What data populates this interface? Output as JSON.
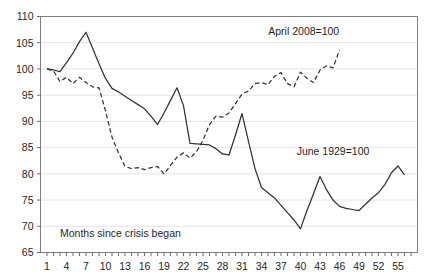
{
  "chart_data": {
    "type": "line",
    "title": "",
    "subtitle": "",
    "xlabel": "Months since crisis began",
    "ylabel": "",
    "xlim": [
      0,
      58
    ],
    "ylim": [
      65,
      110
    ],
    "yticks": [
      65,
      70,
      75,
      80,
      85,
      90,
      95,
      100,
      105,
      110
    ],
    "ytick_labels": [
      "65",
      "70",
      "75",
      "80",
      "85",
      "90",
      "95",
      "100",
      "105",
      "110"
    ],
    "xticks": [
      1,
      2,
      3,
      4,
      5,
      6,
      7,
      8,
      9,
      10,
      11,
      12,
      13,
      14,
      15,
      16,
      17,
      18,
      19,
      20,
      21,
      22,
      23,
      24,
      25,
      26,
      27,
      28,
      29,
      30,
      31,
      32,
      33,
      34,
      35,
      36,
      37,
      38,
      39,
      40,
      41,
      42,
      43,
      44,
      45,
      46,
      47,
      48,
      49,
      50,
      51,
      52,
      53,
      54,
      55,
      56,
      57
    ],
    "xtick_labels_shown": [
      "1",
      "4",
      "7",
      "10",
      "13",
      "16",
      "19",
      "22",
      "25",
      "28",
      "31",
      "34",
      "37",
      "40",
      "43",
      "46",
      "49",
      "52",
      "55"
    ],
    "xtick_label_values": [
      1,
      4,
      7,
      10,
      13,
      16,
      19,
      22,
      25,
      28,
      31,
      34,
      37,
      40,
      43,
      46,
      49,
      52,
      55
    ],
    "grid": "horizontal",
    "legend_position": "inline-annotations",
    "annotations": [
      {
        "text": "April 2008=100",
        "x": 40.5,
        "y": 106.4,
        "series": "april-2008"
      },
      {
        "text": "June 1929=100",
        "x": 45.0,
        "y": 83.6,
        "series": "june-1929"
      },
      {
        "text": "Months since crisis began",
        "x": 3.0,
        "y": 68.0,
        "series": "axis-note"
      }
    ],
    "series": [
      {
        "name": "June 1929=100",
        "style": "solid",
        "color": "#333333",
        "x": [
          1,
          2,
          3,
          4,
          5,
          6,
          7,
          8,
          9,
          10,
          11,
          12,
          13,
          14,
          15,
          16,
          17,
          18,
          19,
          20,
          21,
          22,
          23,
          24,
          25,
          26,
          27,
          28,
          29,
          30,
          31,
          32,
          33,
          34,
          35,
          36,
          37,
          38,
          39,
          40,
          41,
          42,
          43,
          44,
          45,
          46,
          47,
          48,
          49,
          50,
          51,
          52,
          53,
          54,
          55,
          56
        ],
        "values": [
          100.0,
          99.8,
          99.5,
          101.2,
          103.0,
          105.2,
          107.0,
          104.0,
          101.0,
          98.2,
          96.3,
          95.6,
          94.8,
          94.0,
          93.2,
          92.4,
          91.0,
          89.4,
          91.6,
          94.0,
          96.4,
          93.0,
          85.8,
          85.7,
          85.6,
          85.5,
          84.8,
          83.8,
          83.6,
          87.4,
          91.5,
          86.2,
          81.0,
          77.4,
          76.4,
          75.4,
          74.0,
          72.6,
          71.2,
          69.5,
          73.0,
          76.2,
          79.5,
          77.0,
          75.0,
          73.8,
          73.4,
          73.2,
          73.0,
          74.2,
          75.4,
          76.4,
          78.0,
          80.2,
          81.5,
          79.8
        ]
      },
      {
        "name": "April 2008=100",
        "style": "dashed",
        "color": "#333333",
        "x": [
          1,
          2,
          3,
          4,
          5,
          6,
          7,
          8,
          9,
          10,
          11,
          12,
          13,
          14,
          15,
          16,
          17,
          18,
          19,
          20,
          21,
          22,
          23,
          24,
          25,
          26,
          27,
          28,
          29,
          30,
          31,
          32,
          33,
          34,
          35,
          36,
          37,
          38,
          39,
          40,
          41,
          42,
          43,
          44,
          45,
          46
        ],
        "values": [
          100.0,
          99.6,
          97.6,
          98.4,
          97.2,
          98.4,
          97.4,
          96.6,
          96.4,
          92.0,
          87.0,
          84.0,
          81.4,
          81.0,
          81.2,
          80.8,
          81.2,
          81.4,
          80.0,
          81.6,
          83.2,
          84.0,
          83.0,
          84.2,
          86.4,
          89.4,
          91.0,
          90.8,
          91.6,
          93.4,
          95.2,
          95.8,
          97.2,
          97.4,
          97.0,
          98.6,
          99.3,
          97.2,
          96.6,
          99.4,
          98.2,
          97.4,
          99.8,
          100.6,
          100.2,
          103.6
        ]
      }
    ]
  },
  "frame": {
    "border_color": "#808080",
    "grid_color": "#e3e3e3",
    "axis_color": "#6b6b6b",
    "background": "#ffffff"
  }
}
